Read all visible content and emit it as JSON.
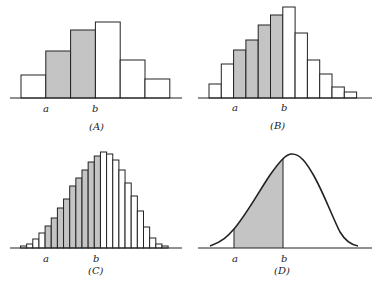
{
  "chart_data": [
    {
      "type": "bar",
      "panel": "A",
      "caption": "(A)",
      "markers": {
        "a": "a",
        "b": "b"
      },
      "values": [
        23,
        47,
        68,
        76,
        38,
        19
      ],
      "shaded": [
        false,
        true,
        true,
        false,
        false,
        false
      ],
      "grid": false
    },
    {
      "type": "bar",
      "panel": "B",
      "caption": "(B)",
      "markers": {
        "a": "a",
        "b": "b"
      },
      "values": [
        14,
        34,
        48,
        58,
        73,
        83,
        91,
        65,
        38,
        24,
        11,
        6
      ],
      "shaded": [
        false,
        false,
        true,
        true,
        true,
        true,
        false,
        false,
        false,
        false,
        false,
        false
      ],
      "grid": false
    },
    {
      "type": "bar",
      "panel": "C",
      "caption": "(C)",
      "markers": {
        "a": "a",
        "b": "b"
      },
      "values": [
        2,
        4,
        9,
        15,
        22,
        30,
        40,
        49,
        62,
        70,
        78,
        86,
        92,
        96,
        94,
        88,
        78,
        65,
        52,
        37,
        21,
        10,
        4,
        2
      ],
      "shaded": [
        false,
        false,
        false,
        false,
        true,
        true,
        true,
        true,
        true,
        true,
        true,
        true,
        true,
        false,
        false,
        false,
        false,
        false,
        false,
        false,
        false,
        false,
        false,
        false
      ],
      "grid": false
    },
    {
      "type": "area",
      "panel": "D",
      "caption": "(D)",
      "markers": {
        "a": "a",
        "b": "b"
      },
      "description": "Smooth bell-shaped density curve with shaded area between a and b",
      "grid": false
    }
  ],
  "colors": {
    "shade": "#c4c4c4",
    "line": "#222222",
    "background": "#ffffff"
  }
}
